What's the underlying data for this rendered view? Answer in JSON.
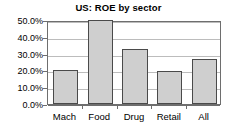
{
  "chart_data": {
    "type": "bar",
    "title": "US: ROE by sector",
    "xlabel": "",
    "ylabel": "",
    "categories": [
      "Mach",
      "Food",
      "Drug",
      "Retail",
      "All"
    ],
    "values": [
      20.2,
      50.0,
      32.5,
      19.5,
      26.5
    ],
    "ylim": [
      0,
      50
    ],
    "ytick_values": [
      0,
      10,
      20,
      30,
      40,
      50
    ],
    "ytick_labels": [
      "0.0%",
      "10.0%",
      "20.0%",
      "30.0%",
      "40.0%",
      "50.0%"
    ],
    "grid": true,
    "legend": false,
    "legend_position": "none",
    "bar_fill_color": "#cfcfcf",
    "bar_border_color": "#4a4a4a",
    "gridline_color": "#bcbcbc",
    "axis_color": "#6e6e6e",
    "background_color": "#ffffff",
    "series": [
      {
        "name": "ROE",
        "values": [
          20.2,
          50.0,
          32.5,
          19.5,
          26.5
        ]
      }
    ]
  }
}
